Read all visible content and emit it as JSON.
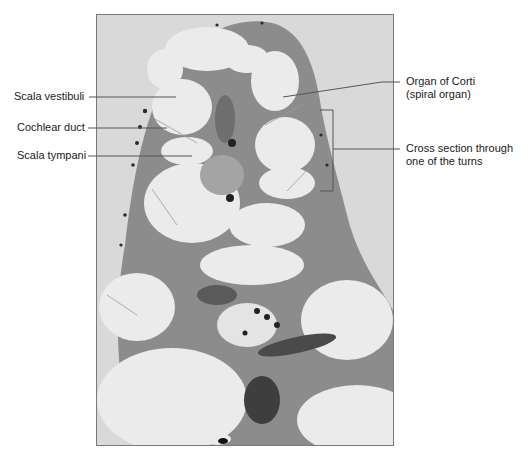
{
  "figure": {
    "type": "light micrograph",
    "colors": {
      "background": "#ffffff",
      "frame_border": "#7a7a7a",
      "outer_field": "#d9d9d9",
      "tissue": "#8c8c8c",
      "fluid_space": "#ebebeb",
      "dark_cells": "#2a2a2a",
      "leader_line": "#555555"
    }
  },
  "labels": {
    "left": [
      {
        "text": "Scala vestibuli"
      },
      {
        "text": "Cochlear duct"
      },
      {
        "text": "Scala tympani"
      }
    ],
    "right": [
      {
        "line1": "Organ of Corti",
        "line2": "(spiral organ)"
      },
      {
        "line1": "Cross section through",
        "line2": "one of the turns"
      }
    ]
  }
}
